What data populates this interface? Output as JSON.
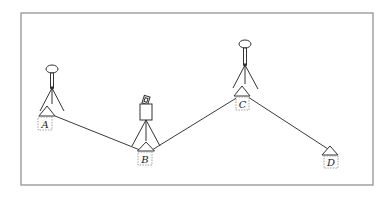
{
  "diagram": {
    "title": "",
    "colors": {
      "background": "#ffffff",
      "frame": "#8a8a8a",
      "line": "#3a3a3a",
      "label_box": "#888888",
      "text": "#222222"
    },
    "frame": {
      "x": 21,
      "y": 13,
      "width": 352,
      "height": 172
    },
    "stations": [
      {
        "id": "A",
        "label": "A",
        "instrument": "prism-target",
        "marker": {
          "apex": [
            47,
            106
          ],
          "base_y": 116,
          "half_width": 8
        },
        "label_box": {
          "x": 38,
          "y": 117,
          "w": 14,
          "h": 13
        }
      },
      {
        "id": "B",
        "label": "B",
        "instrument": "total-station",
        "marker": {
          "apex": [
            146,
            142
          ],
          "base_y": 151,
          "half_width": 8.5
        },
        "label_box": {
          "x": 138,
          "y": 152,
          "w": 14,
          "h": 13
        }
      },
      {
        "id": "C",
        "label": "C",
        "instrument": "prism-target",
        "marker": {
          "apex": [
            242,
            86
          ],
          "base_y": 96,
          "half_width": 8
        },
        "label_box": {
          "x": 236,
          "y": 97,
          "w": 13,
          "h": 13
        }
      },
      {
        "id": "D",
        "label": "D",
        "instrument": "none",
        "marker": {
          "apex": [
            330,
            146
          ],
          "base_y": 155,
          "half_width": 8
        },
        "label_box": {
          "x": 324,
          "y": 156,
          "w": 14,
          "h": 12
        }
      }
    ],
    "connections": [
      {
        "from": "A",
        "to": "B",
        "x1": 55,
        "y1": 116,
        "x2": 140,
        "y2": 150
      },
      {
        "from": "B",
        "to": "C",
        "x1": 152,
        "y1": 150,
        "x2": 238,
        "y2": 97
      },
      {
        "from": "C",
        "to": "D",
        "x1": 248,
        "y1": 97,
        "x2": 328,
        "y2": 149
      }
    ]
  }
}
